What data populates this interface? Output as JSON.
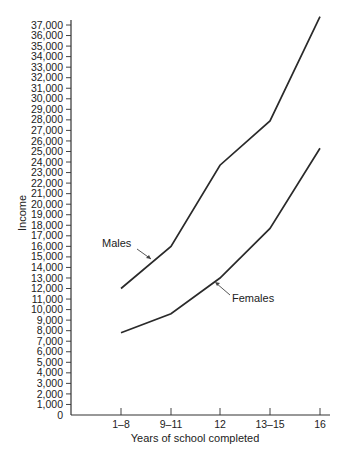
{
  "chart_data": {
    "type": "line",
    "title": "",
    "xlabel": "Years of school completed",
    "ylabel": "Income",
    "categories": [
      "1–8",
      "9–11",
      "12",
      "13–15",
      "16"
    ],
    "series": [
      {
        "name": "Males",
        "values": [
          12000,
          16000,
          23700,
          27900,
          37800
        ]
      },
      {
        "name": "Females",
        "values": [
          7800,
          9600,
          13000,
          17700,
          25300
        ]
      }
    ],
    "ylim": [
      0,
      37000
    ],
    "ytick_step": 1000,
    "yticks": [
      "0",
      "1,000",
      "2,000",
      "3,000",
      "4,000",
      "5,000",
      "6,000",
      "7,000",
      "8,000",
      "9,000",
      "10,000",
      "11,000",
      "12,000",
      "13,000",
      "14,000",
      "15,000",
      "16,000",
      "17,000",
      "18,000",
      "19,000",
      "20,000",
      "21,000",
      "22,000",
      "23,000",
      "24,000",
      "25,000",
      "26,000",
      "27,000",
      "28,000",
      "29,000",
      "30,000",
      "31,000",
      "32,000",
      "33,000",
      "34,000",
      "35,000",
      "36,000",
      "37,000"
    ],
    "grid": false,
    "legend": "inline labels with pointer arrows",
    "annotations": [
      "Males",
      "Females"
    ]
  },
  "colors": {
    "line": "#2a2a2a",
    "axis": "#333333",
    "background": "#ffffff"
  }
}
